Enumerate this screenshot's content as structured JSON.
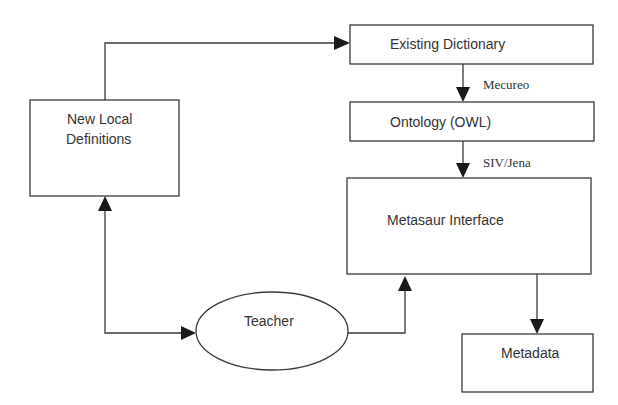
{
  "diagram": {
    "nodes": {
      "new_local_definitions": {
        "line1": "New Local",
        "line2": "Definitions",
        "shape": "rectangle"
      },
      "existing_dictionary": {
        "label": "Existing Dictionary",
        "shape": "rectangle"
      },
      "ontology": {
        "label": "Ontology (OWL)",
        "shape": "rectangle"
      },
      "metasaur_interface": {
        "label": "Metasaur Interface",
        "shape": "rectangle"
      },
      "metadata": {
        "label": "Metadata",
        "shape": "rectangle"
      },
      "teacher": {
        "label": "Teacher",
        "shape": "ellipse"
      }
    },
    "edges": [
      {
        "from": "New Local Definitions",
        "to": "Existing Dictionary",
        "label": ""
      },
      {
        "from": "Existing Dictionary",
        "to": "Ontology (OWL)",
        "label": "Mecureo"
      },
      {
        "from": "Ontology (OWL)",
        "to": "Metasaur Interface",
        "label": "SIV/Jena"
      },
      {
        "from": "Metasaur Interface",
        "to": "Metadata",
        "label": ""
      },
      {
        "from": "Teacher",
        "to": "Metasaur Interface",
        "label": ""
      },
      {
        "from": "Teacher",
        "to": "New Local Definitions",
        "label": "",
        "bidirectional": true
      }
    ],
    "edge_labels": {
      "mecureo": "Mecureo",
      "siv_jena": "SIV/Jena"
    },
    "colors": {
      "stroke": "#3a3a3a",
      "arrowhead": "#1a1a1a",
      "text": "#333333",
      "background": "#ffffff"
    }
  }
}
